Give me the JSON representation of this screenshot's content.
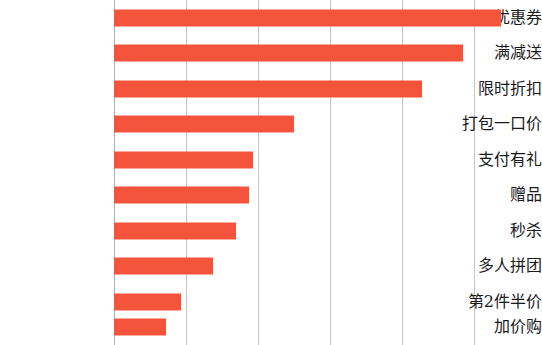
{
  "chart_data": {
    "type": "bar",
    "orientation": "horizontal",
    "title": "",
    "subtitle": "",
    "xlabel": "",
    "ylabel": "",
    "categories": [
      "优惠券",
      "满减送",
      "限时折扣",
      "打包一口价",
      "支付有礼",
      "赠品",
      "秒杀",
      "多人拼团",
      "第2件半价",
      "加价购"
    ],
    "values": [
      5.37,
      4.85,
      4.28,
      2.5,
      1.93,
      1.88,
      1.69,
      1.37,
      0.93,
      0.72
    ],
    "xlim": [
      0,
      6
    ],
    "xticks": [
      0,
      1,
      2,
      3,
      4,
      5
    ],
    "xticklabels": [
      "",
      "",
      "",
      "",
      "",
      ""
    ],
    "grid": "vertical",
    "legend": "none",
    "bar_color": "#f4543c",
    "gridline_color": "#b9bcbe",
    "axis_color": "#9aa0a3",
    "background": "#ffffff"
  }
}
